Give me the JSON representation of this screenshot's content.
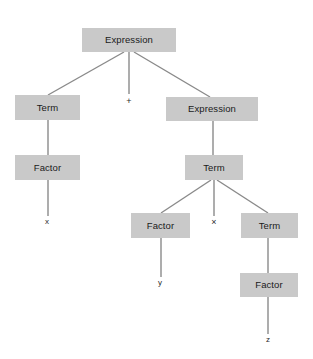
{
  "figure": {
    "kind": "parse-tree",
    "expression": "x + y × z",
    "background_color": "#ffffff",
    "node_fill_color": "#c9c9c9",
    "node_text_color": "#1a1a1a",
    "edge_color": "#8a8a8a",
    "leaf_text_color": "#2b2b2b"
  },
  "nodes": [
    {
      "id": "root_expression",
      "label": "Expression",
      "x": 82,
      "y": 28,
      "w": 94,
      "h": 24
    },
    {
      "id": "left_term",
      "label": "Term",
      "x": 15,
      "y": 95,
      "w": 65,
      "h": 25
    },
    {
      "id": "left_factor",
      "label": "Factor",
      "x": 15,
      "y": 155,
      "w": 65,
      "h": 25
    },
    {
      "id": "right_expression",
      "label": "Expression",
      "x": 166,
      "y": 97,
      "w": 92,
      "h": 24
    },
    {
      "id": "mid_term",
      "label": "Term",
      "x": 185,
      "y": 155,
      "w": 58,
      "h": 25
    },
    {
      "id": "mid_factor",
      "label": "Factor",
      "x": 131,
      "y": 213,
      "w": 59,
      "h": 25
    },
    {
      "id": "right_term",
      "label": "Term",
      "x": 241,
      "y": 213,
      "w": 57,
      "h": 25
    },
    {
      "id": "right_factor",
      "label": "Factor",
      "x": 240,
      "y": 273,
      "w": 58,
      "h": 24
    }
  ],
  "terminals": [
    {
      "id": "terminal_plus",
      "label": "+",
      "x": 129,
      "y": 101
    },
    {
      "id": "terminal_x",
      "label": "x",
      "x": 47,
      "y": 222
    },
    {
      "id": "terminal_times",
      "label": "×",
      "x": 214,
      "y": 222
    },
    {
      "id": "terminal_y",
      "label": "y",
      "x": 160,
      "y": 283
    },
    {
      "id": "terminal_z",
      "label": "z",
      "x": 268,
      "y": 340
    }
  ],
  "edges": [
    {
      "id": "edge-root-to-left-term",
      "x1": 124,
      "y1": 52,
      "x2": 48,
      "y2": 95
    },
    {
      "id": "edge-root-to-plus",
      "x1": 129,
      "y1": 52,
      "x2": 129,
      "y2": 94
    },
    {
      "id": "edge-root-to-right-expression",
      "x1": 134,
      "y1": 52,
      "x2": 210,
      "y2": 97
    },
    {
      "id": "edge-left-term-to-factor",
      "x1": 48,
      "y1": 120,
      "x2": 48,
      "y2": 155
    },
    {
      "id": "edge-left-factor-to-x",
      "x1": 48,
      "y1": 180,
      "x2": 48,
      "y2": 216
    },
    {
      "id": "edge-right-expression-to-term",
      "x1": 213,
      "y1": 121,
      "x2": 213,
      "y2": 155
    },
    {
      "id": "edge-mid-term-to-factor",
      "x1": 211,
      "y1": 180,
      "x2": 161,
      "y2": 213
    },
    {
      "id": "edge-mid-term-to-times",
      "x1": 214,
      "y1": 180,
      "x2": 214,
      "y2": 216
    },
    {
      "id": "edge-mid-term-to-right-term",
      "x1": 217,
      "y1": 180,
      "x2": 268,
      "y2": 213
    },
    {
      "id": "edge-mid-factor-to-y",
      "x1": 161,
      "y1": 238,
      "x2": 161,
      "y2": 277
    },
    {
      "id": "edge-right-term-to-factor",
      "x1": 268,
      "y1": 238,
      "x2": 268,
      "y2": 273
    },
    {
      "id": "edge-right-factor-to-z",
      "x1": 268,
      "y1": 297,
      "x2": 268,
      "y2": 334
    }
  ]
}
